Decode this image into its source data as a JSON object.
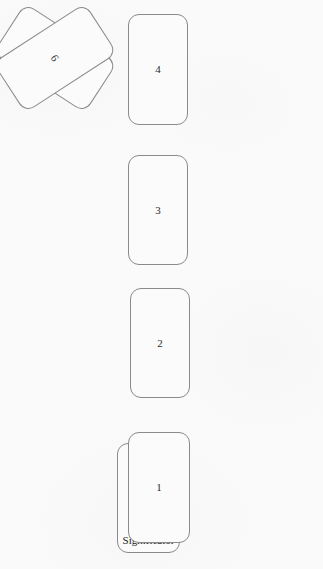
{
  "diagram": {
    "background_color": "#fafafb",
    "card_border_color": "#8a8a8e",
    "card_fill_color": "#fbfbfc",
    "text_color": "#2b2b2e",
    "cards": [
      {
        "id": "card-1",
        "label": "1",
        "position": "bottom-center",
        "rotation_deg": 0,
        "overlaps": "significator"
      },
      {
        "id": "card-2",
        "label": "2",
        "position": "lower-center",
        "rotation_deg": 0
      },
      {
        "id": "card-3",
        "label": "3",
        "position": "upper-center",
        "rotation_deg": 0
      },
      {
        "id": "card-4",
        "label": "4",
        "position": "top-center",
        "rotation_deg": 0
      },
      {
        "id": "card-5",
        "label": "5",
        "position": "middle-left",
        "rotation_deg": -57
      },
      {
        "id": "card-6",
        "label": "6",
        "position": "middle-right",
        "rotation_deg": 57
      }
    ],
    "significator": {
      "id": "card-significator",
      "label": "Significator",
      "position": "bottom-center-behind",
      "rotation_deg": 0
    }
  }
}
